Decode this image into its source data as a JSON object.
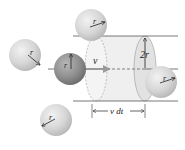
{
  "figure": {
    "labels": {
      "radius": "r",
      "velocity": "v",
      "diameter": "2r",
      "length": "v dt"
    },
    "colors": {
      "sphere_light": "#d4d4d4",
      "sphere_dark": "#8f8f8f",
      "cylinder_fill": "#eeeeee",
      "line": "#555555",
      "arrow": "#222222",
      "velocity_arrow": "#9a9a9a"
    },
    "molecules": [
      {
        "id": "top",
        "type": "light",
        "label": "r"
      },
      {
        "id": "left",
        "type": "light",
        "label": "r"
      },
      {
        "id": "moving",
        "type": "dark",
        "label": "r"
      },
      {
        "id": "bottom-left",
        "type": "light",
        "label": "r"
      },
      {
        "id": "inside-right",
        "type": "light",
        "label": "r"
      }
    ]
  }
}
